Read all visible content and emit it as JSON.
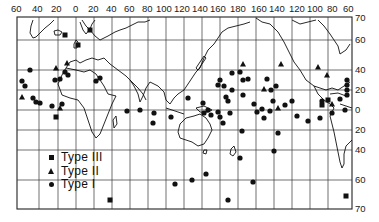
{
  "map": {
    "title": "",
    "top_longitude_labels": [
      "60",
      "40",
      "20",
      "0",
      "20",
      "40",
      "60",
      "80",
      "100",
      "120",
      "140",
      "160",
      "180",
      "160",
      "140",
      "120",
      "100",
      "80",
      "60"
    ],
    "right_latitude_labels": [
      "70",
      "60",
      "40",
      "20",
      "0",
      "20",
      "40",
      "60",
      "70"
    ],
    "legend": {
      "items": [
        {
          "symbol": "square",
          "label": "Type III"
        },
        {
          "symbol": "triangle",
          "label": "Type II"
        },
        {
          "symbol": "circle",
          "label": "Type I"
        }
      ]
    },
    "colors": {
      "ink": "#111111",
      "grid": "#333333",
      "background": "#ffffff"
    }
  },
  "chart_data": {
    "type": "scatter",
    "title": "",
    "xlabel": "Longitude",
    "ylabel": "Latitude",
    "x_tick_labels": [
      "60W",
      "40W",
      "20W",
      "0",
      "20E",
      "40E",
      "60E",
      "80E",
      "100E",
      "120E",
      "140E",
      "160E",
      "180",
      "160W",
      "140W",
      "120W",
      "100W",
      "80W",
      "60W"
    ],
    "y_tick_labels": [
      "70N",
      "60N",
      "40N",
      "20N",
      "0",
      "20S",
      "40S",
      "60S",
      "70S"
    ],
    "grid": true,
    "legend_position": "lower-left",
    "series": [
      {
        "name": "Type III",
        "marker": "square",
        "points_px": [
          [
            65,
            35
          ],
          [
            90,
            30
          ],
          [
            78,
            45
          ],
          [
            56,
            117
          ],
          [
            110,
            200
          ],
          [
            346,
            196
          ],
          [
            328,
            100
          ],
          [
            322,
            105
          ]
        ]
      },
      {
        "name": "Type II",
        "marker": "triangle",
        "points_px": [
          [
            56,
            68
          ],
          [
            67,
            63
          ],
          [
            60,
            108
          ],
          [
            22,
            97
          ],
          [
            243,
            64
          ],
          [
            281,
            64
          ],
          [
            318,
            67
          ],
          [
            278,
            108
          ],
          [
            264,
            89
          ],
          [
            332,
            104
          ],
          [
            327,
            75
          ]
        ]
      },
      {
        "name": "Type I",
        "marker": "circle",
        "points_px": [
          [
            30,
            70
          ],
          [
            22,
            81
          ],
          [
            25,
            86
          ],
          [
            55,
            80
          ],
          [
            60,
            79
          ],
          [
            65,
            72
          ],
          [
            68,
            75
          ],
          [
            52,
            106
          ],
          [
            62,
            104
          ],
          [
            33,
            98
          ],
          [
            36,
            102
          ],
          [
            40,
            103
          ],
          [
            96,
            81
          ],
          [
            100,
            78
          ],
          [
            127,
            111
          ],
          [
            140,
            110
          ],
          [
            154,
            113
          ],
          [
            153,
            123
          ],
          [
            171,
            117
          ],
          [
            188,
            98
          ],
          [
            203,
            103
          ],
          [
            204,
            113
          ],
          [
            208,
            110
          ],
          [
            211,
            115
          ],
          [
            218,
            112
          ],
          [
            220,
            117
          ],
          [
            223,
            123
          ],
          [
            228,
            101
          ],
          [
            230,
            113
          ],
          [
            232,
            73
          ],
          [
            220,
            80
          ],
          [
            218,
            85
          ],
          [
            224,
            86
          ],
          [
            226,
            97
          ],
          [
            232,
            90
          ],
          [
            240,
            72
          ],
          [
            243,
            80
          ],
          [
            243,
            95
          ],
          [
            248,
            79
          ],
          [
            254,
            104
          ],
          [
            257,
            112
          ],
          [
            262,
            109
          ],
          [
            264,
            118
          ],
          [
            270,
            111
          ],
          [
            276,
            86
          ],
          [
            267,
            79
          ],
          [
            271,
            90
          ],
          [
            273,
            101
          ],
          [
            285,
            105
          ],
          [
            292,
            101
          ],
          [
            297,
            116
          ],
          [
            278,
            133
          ],
          [
            242,
            131
          ],
          [
            175,
            184
          ],
          [
            206,
            174
          ],
          [
            274,
            151
          ],
          [
            308,
            121
          ],
          [
            320,
            118
          ],
          [
            332,
            113
          ],
          [
            322,
            101
          ],
          [
            340,
            99
          ],
          [
            345,
            110
          ],
          [
            347,
            80
          ],
          [
            347,
            85
          ],
          [
            347,
            90
          ],
          [
            347,
            95
          ],
          [
            192,
            180
          ],
          [
            253,
            182
          ],
          [
            240,
            158
          ],
          [
            228,
            200
          ]
        ]
      }
    ]
  }
}
